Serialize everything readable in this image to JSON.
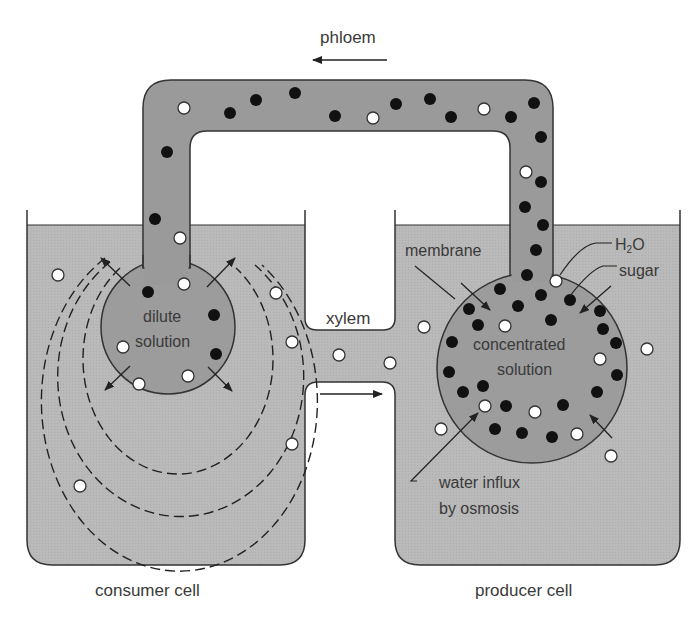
{
  "diagram": {
    "colors": {
      "background": "#ffffff",
      "cell_fluid": "#b9b9b9",
      "phloem_fluid": "#9a9a9a",
      "solution_fill": "#9c9c9c",
      "outline": "#333333",
      "sugar_dot": "#111111",
      "water_dot": "#ffffff",
      "label_text": "#3a3a3a"
    },
    "labels": {
      "phloem": "phloem",
      "xylem": "xylem",
      "dilute_line1": "dilute",
      "dilute_line2": "solution",
      "concentrated_line1": "concentrated",
      "concentrated_line2": "solution",
      "membrane": "membrane",
      "h2o_main": "H",
      "h2o_sub": "2",
      "h2o_tail": "O",
      "sugar": "sugar",
      "water_influx_line1": "water influx",
      "water_influx_line2": "by osmosis",
      "consumer_cell": "consumer cell",
      "producer_cell": "producer cell"
    },
    "flow_directions": {
      "phloem": "right-to-left (producer to consumer)",
      "xylem": "left-to-right (consumer to producer)"
    },
    "legend": {
      "sugar_symbol": "black dot",
      "water_symbol": "white dot"
    }
  }
}
